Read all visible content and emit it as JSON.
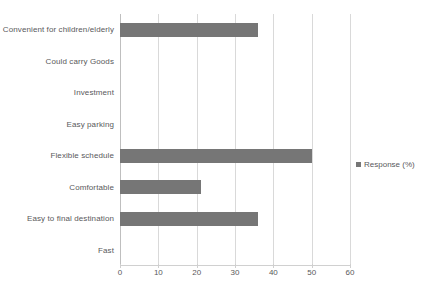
{
  "chart_data": {
    "type": "bar",
    "orientation": "horizontal",
    "title": "",
    "xlabel": "",
    "ylabel": "",
    "xlim": [
      0,
      60
    ],
    "xticks": [
      0,
      10,
      20,
      30,
      40,
      50,
      60
    ],
    "grid": true,
    "legend": {
      "position": "right",
      "entries": [
        "Response (%)"
      ]
    },
    "series_name": "Response (%)",
    "bar_color": "#767676",
    "categories": [
      "Convenient for children/elderly",
      "Could carry Goods",
      "Investment",
      "Easy parking",
      "Flexible schedule",
      "Comfortable",
      "Easy to final destination",
      "Fast"
    ],
    "values": [
      36,
      0,
      0,
      0,
      50,
      21,
      36,
      0
    ]
  }
}
